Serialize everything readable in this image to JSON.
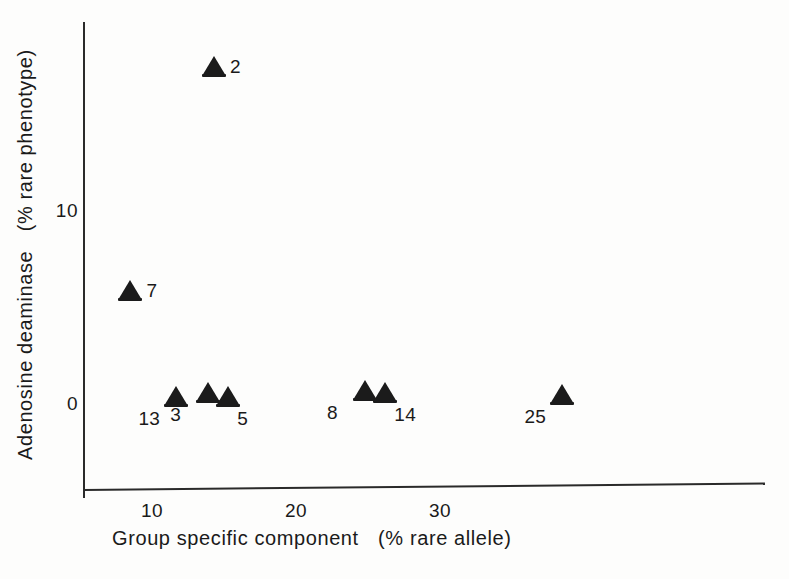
{
  "figure": {
    "background_color": "#fdfdfc",
    "marker_color": "#1b1b1b",
    "axis_color": "#2a2a2a"
  },
  "chart_data": {
    "type": "scatter",
    "title": "",
    "xlabel": "Group specific component  (% rare allele)",
    "ylabel": "Adenosine deaminase  (% rare phenotype)",
    "xlim": [
      5.5,
      41.5
    ],
    "ylim": [
      -2.5,
      19.5
    ],
    "xticks": [
      10,
      20,
      30
    ],
    "xtick_labels": [
      "10",
      "20",
      "30"
    ],
    "yticks": [
      0,
      10
    ],
    "ytick_labels": [
      "0",
      "10"
    ],
    "grid": false,
    "legend": null,
    "marker_style": "filled-triangle",
    "points": [
      {
        "label": "2",
        "x": 14.3,
        "y": 17.4,
        "label_side": "right"
      },
      {
        "label": "7",
        "x": 8.5,
        "y": 5.8,
        "label_side": "right"
      },
      {
        "label": "13",
        "x": 11.7,
        "y": 0.3,
        "label_side": "below-left"
      },
      {
        "label": "3",
        "x": 13.9,
        "y": 0.5,
        "label_side": "below-left"
      },
      {
        "label": "5",
        "x": 15.3,
        "y": 0.3,
        "label_side": "below-right"
      },
      {
        "label": "8",
        "x": 24.8,
        "y": 0.6,
        "label_side": "below-left"
      },
      {
        "label": "14",
        "x": 26.2,
        "y": 0.5,
        "label_side": "below-right"
      },
      {
        "label": "25",
        "x": 38.5,
        "y": 0.4,
        "label_side": "below-left"
      }
    ]
  },
  "axis_titles": {
    "x": {
      "part1": "Group specific component",
      "part2": "(% rare allele)"
    },
    "y": {
      "part1": "Adenosine deaminase",
      "part2": "(% rare phenotype)"
    }
  }
}
